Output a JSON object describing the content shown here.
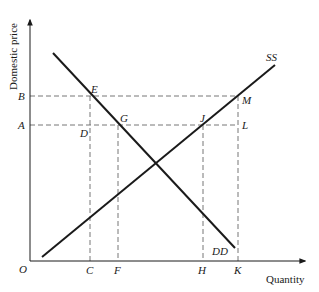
{
  "diagram": {
    "type": "supply-demand",
    "axes": {
      "y_label": "Domestic price",
      "x_label": "Quantity",
      "origin_label": "O"
    },
    "curves": {
      "supply": {
        "label": "SS"
      },
      "demand": {
        "label": "DD"
      }
    },
    "price_levels": [
      {
        "label": "B"
      },
      {
        "label": "A"
      }
    ],
    "quantity_levels": [
      {
        "label": "C"
      },
      {
        "label": "F"
      },
      {
        "label": "H"
      },
      {
        "label": "K"
      }
    ],
    "points": {
      "E": "E",
      "G": "G",
      "D": "D",
      "J": "J",
      "M": "M",
      "L": "L"
    },
    "colors": {
      "line": "#1a1a1a",
      "dashed": "#666666"
    }
  }
}
